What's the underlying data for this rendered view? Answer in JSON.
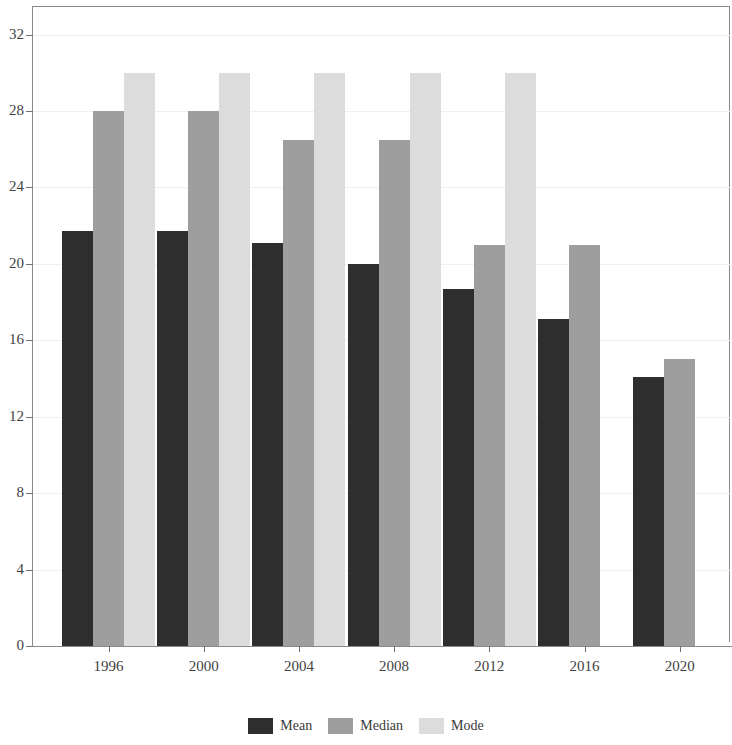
{
  "chart_data": {
    "type": "bar",
    "title": "",
    "subtitle": "",
    "xlabel": "",
    "ylabel": "",
    "categories": [
      "1996",
      "2000",
      "2004",
      "2008",
      "2012",
      "2016",
      "2020"
    ],
    "series": [
      {
        "name": "Mean",
        "color": "#2e2e2e",
        "values": [
          21.7,
          21.7,
          21.1,
          20.0,
          18.7,
          17.1,
          14.1
        ]
      },
      {
        "name": "Median",
        "color": "#9e9e9e",
        "values": [
          28.0,
          28.0,
          26.5,
          26.5,
          21.0,
          21.0,
          15.0
        ]
      },
      {
        "name": "Mode",
        "color": "#dcdcdc",
        "values": [
          30.0,
          30.0,
          30.0,
          30.0,
          30.0,
          null,
          null
        ]
      }
    ],
    "ylim": [
      0,
      33.5
    ],
    "yticks": [
      0,
      4,
      8,
      12,
      16,
      20,
      24,
      28,
      32
    ],
    "ytick_labels": [
      "0",
      "4",
      "8",
      "12",
      "16",
      "20",
      "24",
      "28",
      "32"
    ],
    "xtick_labels": [
      "1996",
      "2000",
      "2004",
      "2008",
      "2012",
      "2016",
      "2020"
    ],
    "grid": true,
    "grid_color": "#f0f0f0",
    "legend_position": "bottom",
    "legend_entries": [
      "Mean",
      "Median",
      "Mode"
    ],
    "axis_color": "#8a8a8a",
    "background": "#ffffff"
  }
}
